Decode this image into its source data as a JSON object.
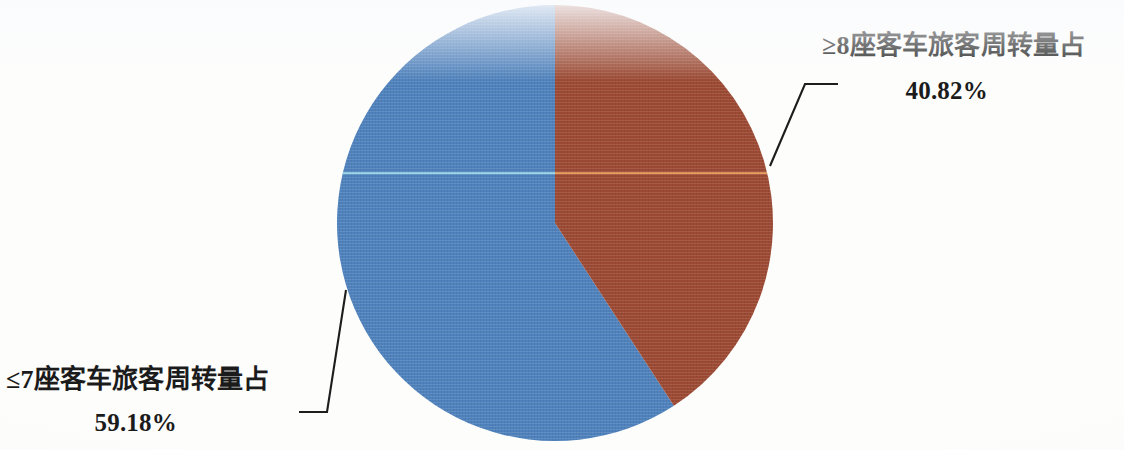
{
  "chart_data": {
    "type": "pie",
    "title": "",
    "subtitle": "",
    "xlabel": "",
    "ylabel": "",
    "legend_position": "none",
    "grid": false,
    "start_angle_deg": 0,
    "direction": "clockwise",
    "categories": [
      "≥8座客车旅客周转量占",
      "≤7座客车旅客周转量占"
    ],
    "values": [
      40.82,
      59.18
    ],
    "value_labels": [
      "40.82%",
      "59.18%"
    ],
    "colors": [
      "#9c4a33",
      "#4f82bd"
    ],
    "slices": [
      {
        "name": "≥8座客车旅客周转量占",
        "value": 40.82,
        "value_label": "40.82%",
        "color": "#9c4a33",
        "start_deg": 0,
        "end_deg": 146.95
      },
      {
        "name": "≤7座客车旅客周转量占",
        "value": 59.18,
        "value_label": "59.18%",
        "color": "#4f82bd",
        "start_deg": 146.95,
        "end_deg": 360
      }
    ]
  },
  "labels": {
    "brown": {
      "title": "≥8座客车旅客周转量占",
      "value": "40.82%"
    },
    "blue": {
      "title": "≤7座客车旅客周转量占",
      "value": "59.18%"
    }
  },
  "style": {
    "blue": "#4f82bd",
    "brown": "#9c4a33",
    "leader_line": "#1d1d1d",
    "scanline_blue": "#9fd8e6",
    "scanline_brown": "#e7a05f",
    "background": "#fdfdfc"
  }
}
